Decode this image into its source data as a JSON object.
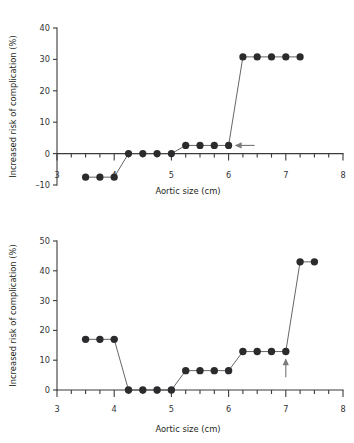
{
  "figure": {
    "panels": [
      "top",
      "bottom"
    ]
  },
  "chart_data": [
    {
      "id": "top",
      "type": "line",
      "title": "",
      "xlabel": "Aortic size (cm)",
      "ylabel": "Increased risk of complication (%)",
      "xlim": [
        3,
        8
      ],
      "ylim": [
        -10,
        40
      ],
      "xticks": [
        3,
        4,
        5,
        6,
        7,
        8
      ],
      "xtick_labels": [
        "3",
        "4",
        "5",
        "6",
        "7",
        "8"
      ],
      "xminor_step": 0.25,
      "yticks": [
        -10,
        0,
        10,
        20,
        30,
        40
      ],
      "ytick_labels": [
        "-10",
        "0",
        "10",
        "20",
        "30",
        "40"
      ],
      "grid": false,
      "legend": "none",
      "x": [
        3.5,
        3.75,
        4.0,
        4.25,
        4.5,
        4.75,
        5.0,
        5.25,
        5.5,
        5.75,
        6.0,
        6.25,
        6.5,
        6.75,
        7.0,
        7.25
      ],
      "y": [
        -7.5,
        -7.5,
        -7.5,
        0,
        0,
        0,
        0,
        2.6,
        2.6,
        2.6,
        2.6,
        30.8,
        30.8,
        30.8,
        30.8,
        30.8
      ],
      "annotations": [
        {
          "kind": "arrow",
          "direction": "left",
          "x": 6.0,
          "y": 2.6,
          "label": ""
        }
      ]
    },
    {
      "id": "bottom",
      "type": "line",
      "title": "",
      "xlabel": "Aortic size (cm)",
      "ylabel": "Increased risk of complication (%)",
      "xlim": [
        3,
        8
      ],
      "ylim": [
        0,
        50
      ],
      "xticks": [
        3,
        4,
        5,
        6,
        7,
        8
      ],
      "xtick_labels": [
        "3",
        "4",
        "5",
        "6",
        "7",
        "8"
      ],
      "xminor_step": 0.25,
      "yticks": [
        0,
        10,
        20,
        30,
        40,
        50
      ],
      "ytick_labels": [
        "0",
        "10",
        "20",
        "30",
        "40",
        "50"
      ],
      "grid": false,
      "legend": "none",
      "x": [
        3.5,
        3.75,
        4.0,
        4.25,
        4.5,
        4.75,
        5.0,
        5.25,
        5.5,
        5.75,
        6.0,
        6.25,
        6.5,
        6.75,
        7.0,
        7.25,
        7.5
      ],
      "y": [
        17,
        17,
        17,
        0,
        0,
        0,
        0,
        6.5,
        6.5,
        6.5,
        6.5,
        12.9,
        12.9,
        12.9,
        12.9,
        43,
        43
      ],
      "annotations": [
        {
          "kind": "arrow",
          "direction": "up",
          "x": 7.0,
          "y": 10.0,
          "label": ""
        }
      ]
    }
  ]
}
